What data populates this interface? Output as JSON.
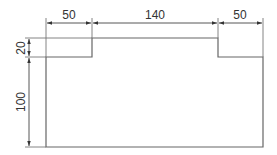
{
  "diagram": {
    "type": "dimensioned-profile-drawing",
    "units_shown": false,
    "line_color": "#555555",
    "background": "#ffffff",
    "horizontal_dimensions": [
      {
        "label": "50",
        "segment": "left-shoulder-width"
      },
      {
        "label": "140",
        "segment": "raised-center-width"
      },
      {
        "label": "50",
        "segment": "right-shoulder-width"
      }
    ],
    "vertical_dimensions": [
      {
        "label": "20",
        "segment": "raised-step-height",
        "orientation": "rotated"
      },
      {
        "label": "100",
        "segment": "body-height",
        "orientation": "rotated"
      }
    ]
  }
}
